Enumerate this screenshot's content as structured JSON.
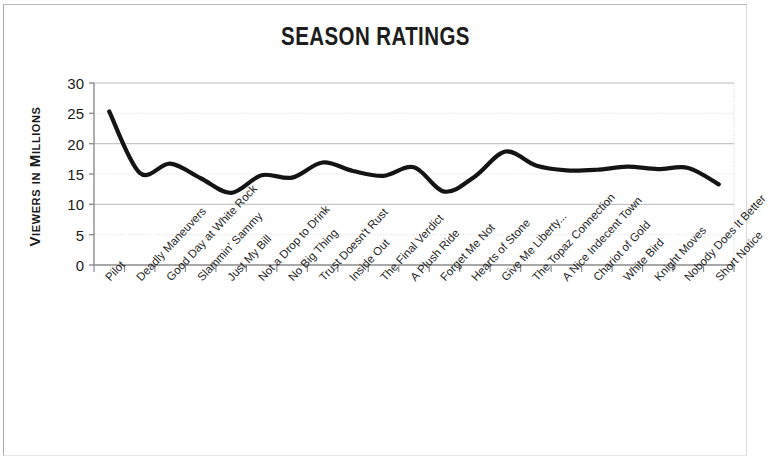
{
  "chart_data": {
    "type": "line",
    "title": "SEASON RATINGS",
    "xlabel": "",
    "ylabel": "Viewers in Millions",
    "ylim": [
      0,
      30
    ],
    "yticks": [
      0,
      5,
      10,
      15,
      20,
      25,
      30
    ],
    "grid": true,
    "legend": "none",
    "smooth": true,
    "line_color": "#141414",
    "categories": [
      "Pilot",
      "Deadly Maneuvers",
      "Good Day at White Rock",
      "Slammin' Sammy",
      "Just My Bill",
      "Not a Drop to Drink",
      "No Big Thing",
      "Trust Doesn't Rust",
      "Inside Out",
      "The Final Verdict",
      "A Plush Ride",
      "Forget Me Not",
      "Hearts of Stone",
      "Give Me Liberty...",
      "The Topaz Connection",
      "A Nice Indecent Town",
      "Chariot of Gold",
      "White Bird",
      "Knight Moves",
      "Nobody Does It Better",
      "Short Notice"
    ],
    "values": [
      25.3,
      15.2,
      16.7,
      14.3,
      11.9,
      14.8,
      14.4,
      16.9,
      15.5,
      14.7,
      16.1,
      12.1,
      14.6,
      18.7,
      16.4,
      15.6,
      15.7,
      16.2,
      15.8,
      16.0,
      13.3
    ]
  },
  "axis": {
    "ytick_labels": [
      "30",
      "25",
      "20",
      "15",
      "10",
      "5",
      "0"
    ]
  }
}
